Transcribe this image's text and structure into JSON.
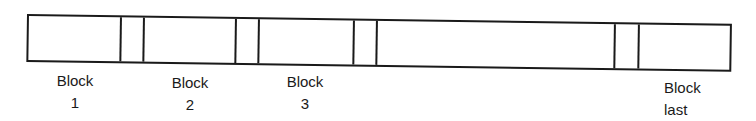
{
  "diagram": {
    "blocks": [
      {
        "line1": "Block",
        "line2": "1"
      },
      {
        "line1": "Block",
        "line2": "2"
      },
      {
        "line1": "Block",
        "line2": "3"
      },
      {
        "line1": "Block",
        "line2": "last"
      }
    ],
    "colors": {
      "stroke": "#1a1a1a",
      "background": "#ffffff"
    }
  }
}
